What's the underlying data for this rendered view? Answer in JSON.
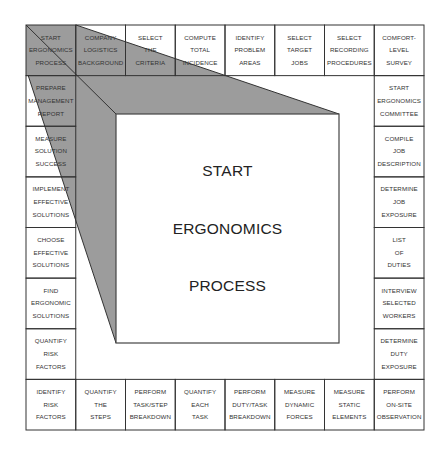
{
  "diagram": {
    "title_lines": [
      "START",
      "ERGONOMICS",
      "PROCESS"
    ],
    "colors": {
      "shade": "#9c9c9c",
      "line": "#333333",
      "background": "#ffffff"
    },
    "top_row": [
      {
        "lines": [
          "START",
          "ERGONOMICS",
          "PROCESS"
        ]
      },
      {
        "lines": [
          "COMPANY",
          "LOGISTICS",
          "BACKGROUND"
        ]
      },
      {
        "lines": [
          "SELECT",
          "THE",
          "CRITERIA"
        ]
      },
      {
        "lines": [
          "COMPUTE",
          "TOTAL",
          "INCIDENCE"
        ]
      },
      {
        "lines": [
          "IDENTIFY",
          "PROBLEM",
          "AREAS"
        ]
      },
      {
        "lines": [
          "SELECT",
          "TARGET",
          "JOBS"
        ]
      },
      {
        "lines": [
          "SELECT",
          "RECORDING",
          "PROCEDURES"
        ]
      },
      {
        "lines": [
          "COMFORT-",
          "LEVEL",
          "SURVEY"
        ]
      }
    ],
    "right_column": [
      {
        "lines": [
          "START",
          "ERGONOMICS",
          "COMMITTEE"
        ]
      },
      {
        "lines": [
          "COMPILE",
          "JOB",
          "DESCRIPTION"
        ]
      },
      {
        "lines": [
          "DETERMINE",
          "JOB",
          "EXPOSURE"
        ]
      },
      {
        "lines": [
          "LIST",
          "OF",
          "DUTIES"
        ]
      },
      {
        "lines": [
          "INTERVIEW",
          "SELECTED",
          "WORKERS"
        ]
      },
      {
        "lines": [
          "DETERMINE",
          "DUTY",
          "EXPOSURE"
        ]
      }
    ],
    "bottom_row": [
      {
        "lines": [
          "IDENTIFY",
          "RISK",
          "FACTORS"
        ]
      },
      {
        "lines": [
          "QUANTIFY",
          "THE",
          "STEPS"
        ]
      },
      {
        "lines": [
          "PERFORM",
          "TASK/STEP",
          "BREAKDOWN"
        ]
      },
      {
        "lines": [
          "QUANTIFY",
          "EACH",
          "TASK"
        ]
      },
      {
        "lines": [
          "PERFORM",
          "DUTY/TASK",
          "BREAKDOWN"
        ]
      },
      {
        "lines": [
          "MEASURE",
          "DYNAMIC",
          "FORCES"
        ]
      },
      {
        "lines": [
          "MEASURE",
          "STATIC",
          "ELEMENTS"
        ]
      },
      {
        "lines": [
          "PERFORM",
          "ON-SITE",
          "OBSERVATION"
        ]
      }
    ],
    "left_column": [
      {
        "lines": [
          "PREPARE",
          "MANAGEMENT",
          "REPORT"
        ]
      },
      {
        "lines": [
          "MEASURE",
          "SOLUTION",
          "SUCCESS"
        ]
      },
      {
        "lines": [
          "IMPLEMENT",
          "EFFECTIVE",
          "SOLUTIONS"
        ]
      },
      {
        "lines": [
          "CHOOSE",
          "EFFECTIVE",
          "SOLUTIONS"
        ]
      },
      {
        "lines": [
          "FIND",
          "ERGONOMIC",
          "SOLUTIONS"
        ]
      },
      {
        "lines": [
          "QUANTIFY",
          "RISK",
          "FACTORS"
        ]
      }
    ]
  }
}
